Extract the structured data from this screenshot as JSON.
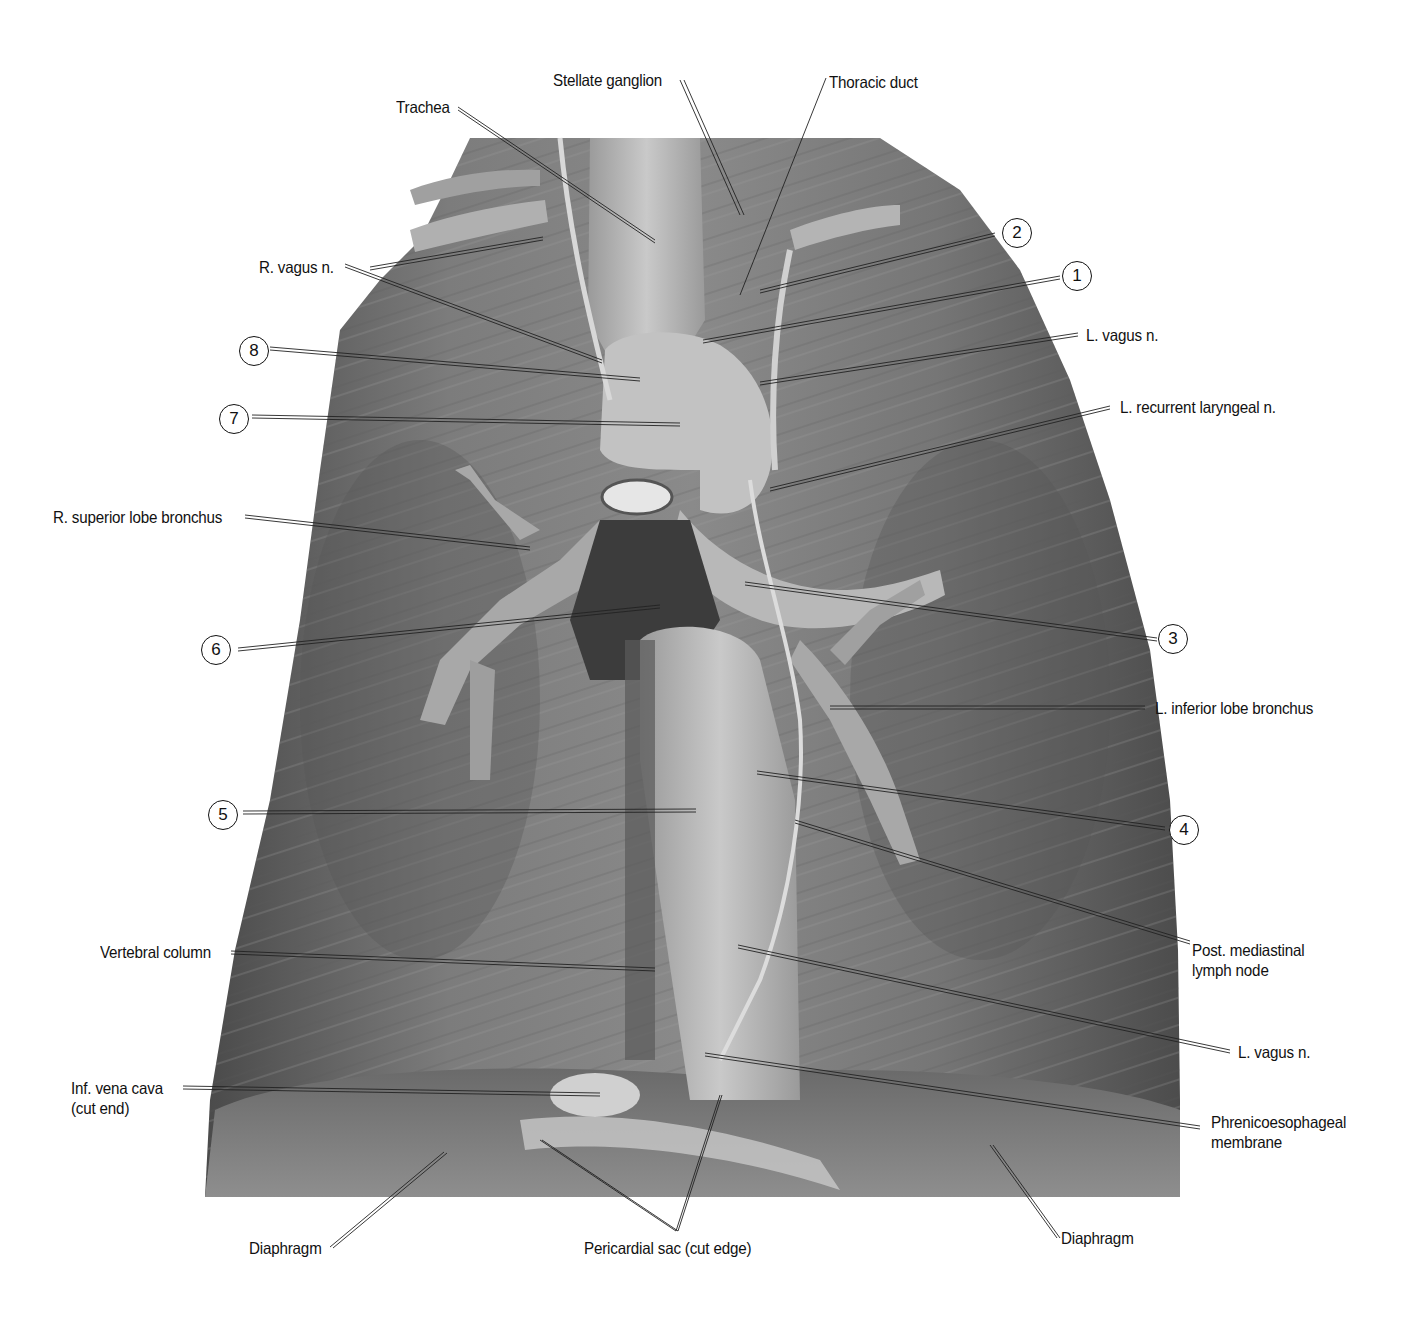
{
  "figure": {
    "style": "grayscale photograph with leader-line callouts",
    "colors": {
      "background": "#ffffff",
      "text": "#111111",
      "leader": "#222222",
      "tissue_dark": "#3a3a3a",
      "tissue_mid": "#6e6e6e",
      "tissue_light": "#c8c8c8"
    }
  },
  "labels": {
    "stellate_ganglion": "Stellate ganglion",
    "thoracic_duct": "Thoracic duct",
    "trachea": "Trachea",
    "r_vagus_n": "R. vagus n.",
    "l_vagus_n_upper": "L. vagus n.",
    "l_recurrent_laryngeal_n": "L. recurrent laryngeal n.",
    "r_superior_lobe_bronchus": "R. superior lobe bronchus",
    "l_inferior_lobe_bronchus": "L. inferior lobe bronchus",
    "post_mediastinal_lymph_node_1": "Post. mediastinal",
    "post_mediastinal_lymph_node_2": "lymph node",
    "vertebral_column": "Vertebral column",
    "l_vagus_n_lower": "L. vagus n.",
    "inf_vena_cava_1": "Inf. vena cava",
    "inf_vena_cava_2": "(cut end)",
    "phrenicoesophageal_1": "Phrenicoesophageal",
    "phrenicoesophageal_2": "membrane",
    "diaphragm_left": "Diaphragm",
    "pericardial_sac": "Pericardial sac (cut edge)",
    "diaphragm_right": "Diaphragm"
  },
  "numbers": {
    "n1": "1",
    "n2": "2",
    "n3": "3",
    "n4": "4",
    "n5": "5",
    "n6": "6",
    "n7": "7",
    "n8": "8"
  }
}
